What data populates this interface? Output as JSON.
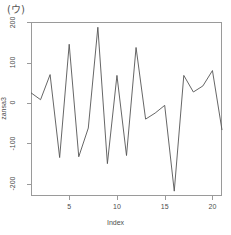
{
  "panel": {
    "label": "(ウ)"
  },
  "chart_data": {
    "type": "line",
    "title": "(ウ)",
    "xlabel": "Index",
    "ylabel": "zansa3",
    "grid": false,
    "legend": "none",
    "xlim": [
      1,
      21
    ],
    "ylim": [
      -230,
      200
    ],
    "xticks": [
      5,
      10,
      15,
      20
    ],
    "xtick_labels": [
      "5",
      "10",
      "15",
      "20"
    ],
    "yticks": [
      200,
      100,
      0,
      -100,
      -200
    ],
    "ytick_labels": [
      "200",
      "100",
      "0",
      "-100",
      "-200"
    ],
    "x": [
      1,
      2,
      3,
      4,
      5,
      6,
      7,
      8,
      9,
      10,
      11,
      12,
      13,
      14,
      15,
      16,
      17,
      18,
      19,
      20,
      21
    ],
    "values": [
      25,
      8,
      70,
      -135,
      145,
      -133,
      -62,
      187,
      -150,
      68,
      -130,
      137,
      -40,
      -25,
      -6,
      -218,
      68,
      27,
      42,
      80,
      -67
    ],
    "series": [
      {
        "name": "zansa3",
        "color": "#555555",
        "values": [
          25,
          8,
          70,
          -135,
          145,
          -133,
          -62,
          187,
          -150,
          68,
          -130,
          137,
          -40,
          -25,
          -6,
          -218,
          68,
          27,
          42,
          80,
          -67
        ]
      }
    ]
  }
}
